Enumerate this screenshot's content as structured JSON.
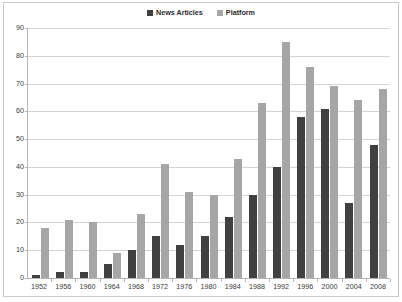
{
  "chart_data": {
    "type": "bar",
    "title": "",
    "subtitle": "",
    "xlabel": "",
    "ylabel": "",
    "ylim": [
      0,
      90
    ],
    "ytick_step": 10,
    "yticks": [
      0,
      10,
      20,
      30,
      40,
      50,
      60,
      70,
      80,
      90
    ],
    "grid": true,
    "legend_position": "top-center",
    "categories": [
      "1952",
      "1956",
      "1960",
      "1964",
      "1968",
      "1972",
      "1976",
      "1980",
      "1984",
      "1988",
      "1992",
      "1996",
      "2000",
      "2004",
      "2008"
    ],
    "series": [
      {
        "name": "News Articles",
        "color": "#404040",
        "values": [
          1,
          2,
          2,
          5,
          10,
          15,
          12,
          15,
          22,
          30,
          40,
          58,
          61,
          27,
          48
        ]
      },
      {
        "name": "Platform",
        "color": "#a6a6a6",
        "values": [
          18,
          21,
          20,
          9,
          23,
          41,
          31,
          30,
          43,
          63,
          85,
          76,
          69,
          64,
          68
        ]
      }
    ]
  },
  "legend": {
    "entries": [
      {
        "label": "News Articles",
        "swatch": "#404040"
      },
      {
        "label": "Platform",
        "swatch": "#a6a6a6"
      }
    ]
  },
  "colors": {
    "news_articles": "#404040",
    "platform": "#a6a6a6",
    "gridline": "#d4d4d4",
    "axis": "#b5b5b5",
    "frame": "#c9c9c9",
    "background": "#ffffff",
    "text": "#3a3a3a"
  }
}
